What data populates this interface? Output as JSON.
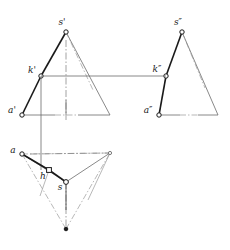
{
  "figure": {
    "type": "descriptive-geometry-drawing",
    "background_color": "#ffffff",
    "ink_color": "#1a1a1a",
    "thin_color": "#6b6b6b",
    "axis_color": "#8a8a8a",
    "width": 230,
    "height": 250
  },
  "labels": {
    "front_apex": "s'",
    "front_pierce": "k'",
    "front_base_left": "a'",
    "side_apex": "s″",
    "side_pierce": "k″",
    "side_base_left": "a″",
    "plan_vertex_a": "a",
    "plan_pierce": "h",
    "plan_apex": "s"
  },
  "views": {
    "front": {
      "name": "front-view",
      "apex": [
        66,
        32
      ],
      "base_left": [
        22,
        115
      ],
      "base_right": [
        110,
        115
      ],
      "pierce": [
        41,
        76
      ],
      "mid_base": [
        66,
        115
      ]
    },
    "side": {
      "name": "side-view",
      "apex": [
        182,
        32
      ],
      "base_left": [
        159,
        115
      ],
      "base_right": [
        218,
        115
      ],
      "pierce": [
        166,
        76
      ],
      "mid_base": [
        182,
        115
      ]
    },
    "plan": {
      "name": "plan-view",
      "center": [
        66,
        182
      ],
      "vertex_a": [
        22,
        154
      ],
      "vertex_right": [
        110,
        153
      ],
      "vertex_bottom": [
        66,
        229
      ],
      "pierce": [
        49,
        170
      ]
    }
  },
  "connectors": {
    "pierce_projector_label": "k'-k″ horizontal projector",
    "pierce_projector_y": 76,
    "vertical_projector_x": 41,
    "vertical_projector_from_y": 76,
    "vertical_projector_to_y": 170
  },
  "line_styles": {
    "solid_heavy": "visible edge",
    "thin_solid": "construction / projector",
    "dash_dot": "axis / hidden centre line",
    "dotted_thin": "hidden edge"
  }
}
